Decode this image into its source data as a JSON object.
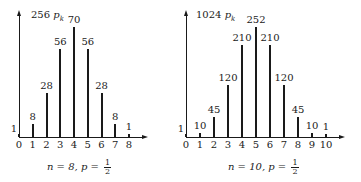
{
  "chart_data": [
    {
      "type": "bar",
      "title": "",
      "ylabel": "256 p_k",
      "xlabel": "",
      "caption": "n = 8, p = 1/2",
      "categories": [
        "0",
        "1",
        "2",
        "3",
        "4",
        "5",
        "6",
        "7",
        "8"
      ],
      "values": [
        1,
        8,
        28,
        56,
        70,
        56,
        28,
        8,
        1
      ],
      "value_labels": [
        "1",
        "8",
        "28",
        "56",
        "70",
        "56",
        "28",
        "8",
        "1"
      ],
      "ylim": [
        0,
        70
      ],
      "grid": false,
      "legend": null
    },
    {
      "type": "bar",
      "title": "",
      "ylabel": "1024 p_k",
      "xlabel": "",
      "caption": "n = 10, p = 1/2",
      "categories": [
        "0",
        "1",
        "2",
        "3",
        "4",
        "5",
        "6",
        "7",
        "8",
        "9",
        "10"
      ],
      "values": [
        1,
        10,
        45,
        120,
        210,
        252,
        210,
        120,
        45,
        10,
        1
      ],
      "value_labels": [
        "1",
        "10",
        "45",
        "120",
        "210",
        "252",
        "210",
        "120",
        "45",
        "10",
        "1"
      ],
      "ylim": [
        0,
        252
      ],
      "grid": false,
      "legend": null
    }
  ],
  "left": {
    "ylabel_coef": "256",
    "ylabel_var": "p",
    "ylabel_sub": "k",
    "caption_n": "n = 8, p =",
    "caption_num": "1",
    "caption_den": "2"
  },
  "right": {
    "ylabel_coef": "1024",
    "ylabel_var": "p",
    "ylabel_sub": "k",
    "caption_n": "n = 10, p =",
    "caption_num": "1",
    "caption_den": "2"
  }
}
